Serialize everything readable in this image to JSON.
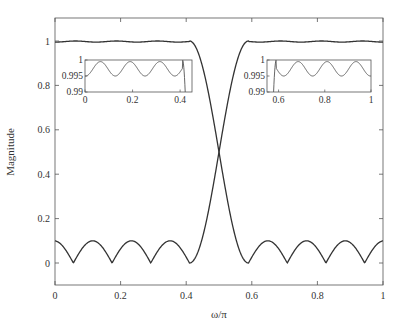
{
  "chart_data": {
    "type": "line",
    "title": "",
    "xlabel": "ω/π",
    "ylabel": "Magnitude",
    "xlim": [
      0,
      1
    ],
    "ylim": [
      -0.1,
      1.1
    ],
    "xticks": [
      0,
      0.2,
      0.4,
      0.6,
      0.8,
      1
    ],
    "xtick_labels": [
      "0",
      "0.2",
      "0.4",
      "0.6",
      "0.8",
      "1"
    ],
    "yticks": [
      0,
      0.2,
      0.4,
      0.6,
      0.8,
      1
    ],
    "ytick_labels": [
      "0",
      "0.2",
      "0.4",
      "0.6",
      "0.8",
      "1"
    ],
    "grid": false,
    "legend": null,
    "series": [
      {
        "name": "lowpass",
        "description": "Lowpass magnitude response: passband ~1 (ripple 0.995-1) from 0 to ~0.41, transition to stopband; stopband ripple peaks ~0.1 with zeros at ~0.59, 0.69, 0.81, 0.94",
        "x": [
          0,
          0.06,
          0.125,
          0.19,
          0.25,
          0.31,
          0.37,
          0.41,
          0.44,
          0.47,
          0.5,
          0.53,
          0.56,
          0.59,
          0.64,
          0.69,
          0.75,
          0.81,
          0.875,
          0.94,
          1.0
        ],
        "y": [
          0.9955,
          1.0,
          0.995,
          1.0,
          0.995,
          1.0,
          0.995,
          1.0,
          0.96,
          0.85,
          0.7,
          0.48,
          0.25,
          0.0,
          0.1,
          0.0,
          0.1,
          0.0,
          0.1,
          0.0,
          0.1
        ]
      },
      {
        "name": "highpass",
        "description": "Highpass magnitude response (mirror of lowpass): stopband ripple peaks ~0.1 with zeros at ~0.06, 0.19, 0.31, 0.41; transition around 0.5; passband ~1 from ~0.59 to 1",
        "x": [
          0,
          0.06,
          0.125,
          0.19,
          0.25,
          0.31,
          0.36,
          0.41,
          0.44,
          0.47,
          0.5,
          0.53,
          0.56,
          0.59,
          0.63,
          0.69,
          0.75,
          0.81,
          0.875,
          0.94,
          1.0
        ],
        "y": [
          0.1,
          0.0,
          0.1,
          0.0,
          0.1,
          0.0,
          0.1,
          0.0,
          0.25,
          0.48,
          0.7,
          0.85,
          0.96,
          1.0,
          0.995,
          1.0,
          0.995,
          1.0,
          0.995,
          1.0,
          0.9955
        ]
      }
    ],
    "annotations": [
      "Crossover of the two responses at ω/π = 0.5, magnitude ≈ 0.7"
    ],
    "insets": [
      {
        "name": "passband-zoom-lowpass",
        "xlim": [
          0,
          0.45
        ],
        "ylim": [
          0.99,
          1.0
        ],
        "xticks": [
          0,
          0.2,
          0.4
        ],
        "xtick_labels": [
          "0",
          "0.2",
          "0.4"
        ],
        "yticks": [
          0.99,
          0.995,
          1
        ],
        "ytick_labels": [
          "0.99",
          "0.995",
          "1"
        ],
        "x": [
          0,
          0.065,
          0.125,
          0.19,
          0.25,
          0.31,
          0.375,
          0.41,
          0.43,
          0.44
        ],
        "y": [
          0.995,
          0.9995,
          0.995,
          0.9995,
          0.995,
          0.9995,
          0.995,
          0.9998,
          0.996,
          0.99
        ]
      },
      {
        "name": "passband-zoom-highpass",
        "xlim": [
          0.55,
          1.0
        ],
        "ylim": [
          0.99,
          1.0
        ],
        "xticks": [
          0.6,
          0.8,
          1
        ],
        "xtick_labels": [
          "0.6",
          "0.8",
          "1"
        ],
        "yticks": [
          0.99,
          0.995,
          1
        ],
        "ytick_labels": [
          "0.99",
          "0.995",
          "1"
        ],
        "x": [
          0.56,
          0.57,
          0.59,
          0.625,
          0.69,
          0.75,
          0.81,
          0.875,
          0.94,
          1.0
        ],
        "y": [
          0.99,
          0.996,
          0.9998,
          0.995,
          0.9995,
          0.995,
          0.9995,
          0.995,
          0.9995,
          0.995
        ]
      }
    ]
  }
}
